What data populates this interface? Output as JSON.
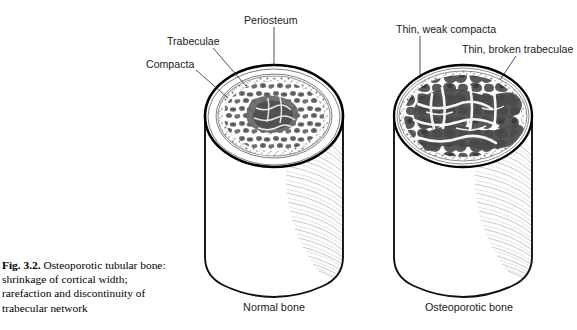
{
  "figure": {
    "number": "Fig. 3.2.",
    "caption_text": " Osteoporotic tubular bone: shrinkage of cortical width; rarefaction and discontinuity of trabecular network",
    "full_caption": "Fig. 3.2. Osteoporotic tubular bone: shrinkage of cortical width; rarefaction and discontinuity of trabecular network"
  },
  "labels": {
    "periosteum": "Periosteum",
    "trabeculae": "Trabeculae",
    "compacta": "Compacta",
    "thin_weak_compacta": "Thin, weak compacta",
    "thin_broken_trabeculae": "Thin, broken trabeculae"
  },
  "specimens": [
    {
      "id": "normal",
      "caption": "Normal bone",
      "compacta_thickness": "thick",
      "trabecular_density": "dense",
      "annotations": [
        "Periosteum",
        "Trabeculae",
        "Compacta"
      ]
    },
    {
      "id": "osteoporotic",
      "caption": "Osteoporotic bone",
      "compacta_thickness": "thin",
      "trabecular_density": "rarefied",
      "annotations": [
        "Thin, weak compacta",
        "Thin, broken trabeculae"
      ]
    }
  ],
  "colors": {
    "background": "#ffffff",
    "outline": "#000000",
    "trabecular_grey": "#7a7a7a",
    "trabecular_dark": "#4d4d4d",
    "shading_grey": "#b5b5b5",
    "text": "#1a1a1a"
  },
  "icons": {
    "leader_line": "leader-line"
  }
}
